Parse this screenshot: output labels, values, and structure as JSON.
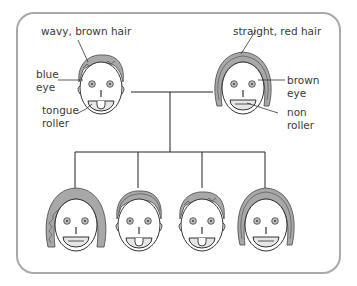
{
  "diagram": {
    "type": "family-inheritance-pedigree",
    "parents": [
      {
        "id": "parent-1",
        "hair": "wavy",
        "hair_color": "brown",
        "eye_color": "blue",
        "tongue": "roller",
        "labels": {
          "hair": "wavy, brown hair",
          "eye_line1": "blue",
          "eye_line2": "eye",
          "tongue_line1": "tongue",
          "tongue_line2": "roller"
        }
      },
      {
        "id": "parent-2",
        "hair": "straight",
        "hair_color": "red",
        "eye_color": "brown",
        "tongue": "non roller",
        "labels": {
          "hair": "straight, red hair",
          "eye_line1": "brown",
          "eye_line2": "eye",
          "tongue_line1": "non",
          "tongue_line2": "roller"
        }
      }
    ],
    "children": [
      {
        "id": "child-1",
        "hair": "wavy",
        "hair_length": "long",
        "tongue": "non roller"
      },
      {
        "id": "child-2",
        "hair": "straight",
        "hair_length": "short",
        "tongue": "roller"
      },
      {
        "id": "child-3",
        "hair": "wavy",
        "hair_length": "short",
        "tongue": "roller"
      },
      {
        "id": "child-4",
        "hair": "straight",
        "hair_length": "long",
        "tongue": "non roller"
      }
    ],
    "colors": {
      "frame": "#a9a9a9",
      "line": "#222222",
      "hair_fill": "#a8a8a8",
      "hair_stroke": "#555555",
      "tongue_fill": "#e8e8e8",
      "text": "#3a3a3a"
    }
  }
}
